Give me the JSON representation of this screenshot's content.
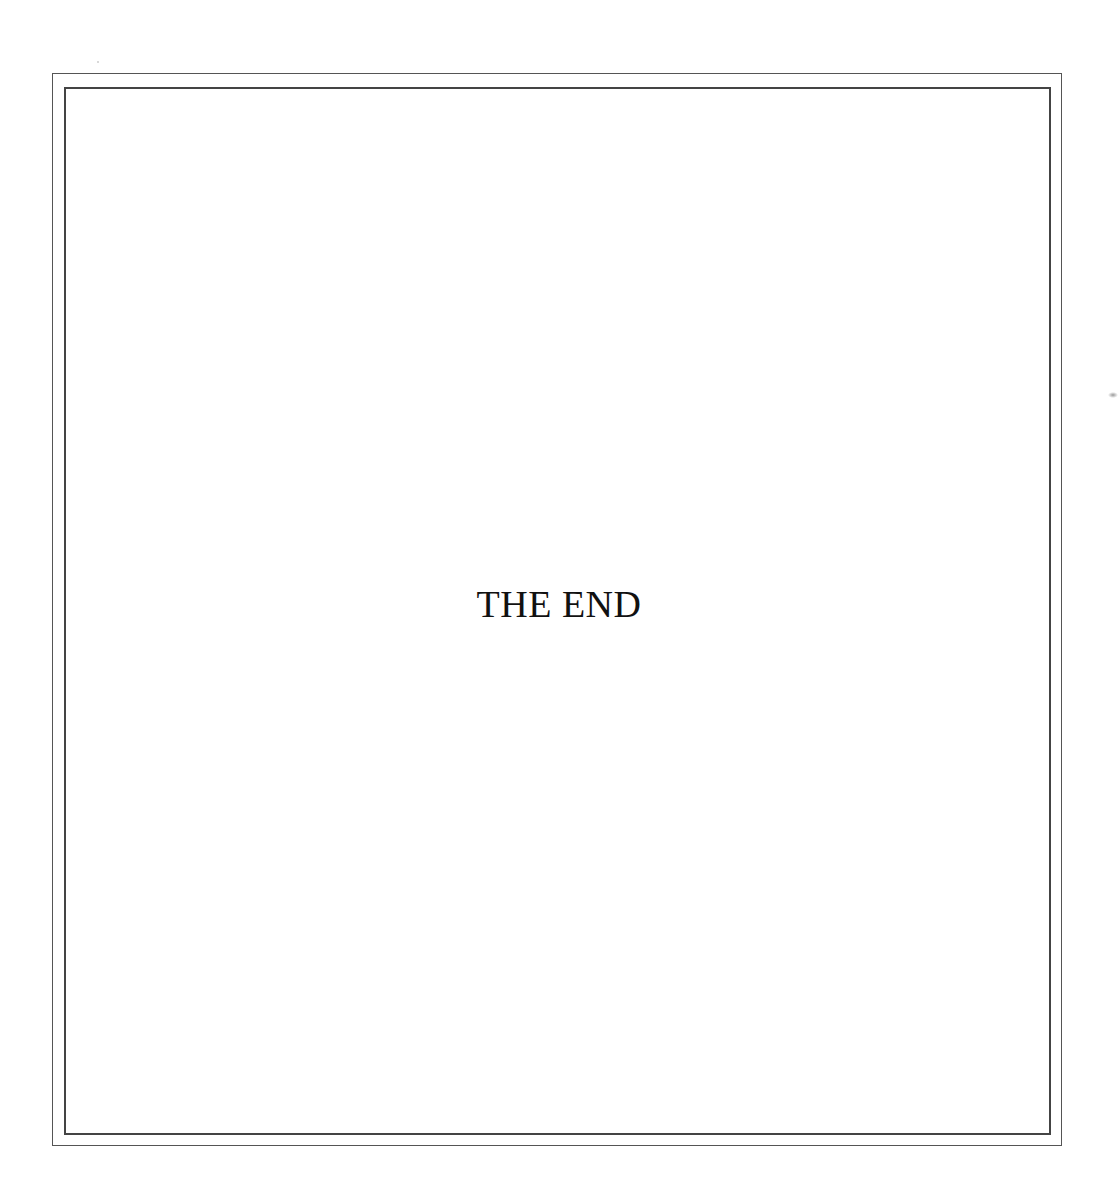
{
  "page": {
    "text": "THE END",
    "colors": {
      "background": "#ffffff",
      "border": "#444444",
      "text": "#111111"
    }
  }
}
